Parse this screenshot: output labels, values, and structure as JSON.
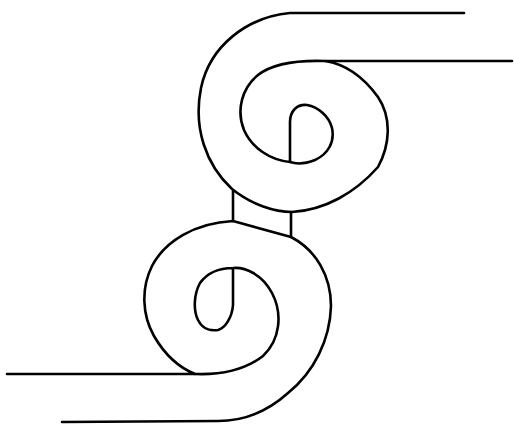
{
  "figure": {
    "width": 514,
    "height": 433,
    "background": "#ffffff",
    "stroke_color": "#000000",
    "stroke_width": 2.6
  },
  "paths": {
    "upper_outer": "M464,13 L290,13 C248,17 210,45 201,88 C193,128 206,165 232,189 C252,205 275,212 292,212 C325,210 355,193 378,167 C390,145 392,118 378,97 C362,75 345,64 325,61 L512,61",
    "upper_inner": "M290,162 L290,122 C290,111 297,104 307,105 C318,107 329,116 332,128 C335,142 328,154 315,160 C305,164 296,164 290,162 C270,160 252,148 244,130 C236,110 242,88 258,75 C272,64 294,60 325,61",
    "connector_left": "M233,191 L233,221",
    "connector_right": "M291,212 L291,237",
    "lower_outer": "M7,374 L195,374 C180,368 165,355 154,336 C142,315 141,288 152,266 C165,241 195,223 233,221 L291,237 C316,250 331,276 331,306 C330,340 314,372 288,393 C268,411 244,421 218,421 L62,422",
    "lower_inner": "M195,374 C220,375 245,370 263,356 C280,340 283,314 272,293 C262,274 245,267 233,268 C220,268 208,272 200,283 C194,294 193,310 198,320 C203,330 212,331 218,330 C225,328 232,318 233,305 L233,268"
  }
}
